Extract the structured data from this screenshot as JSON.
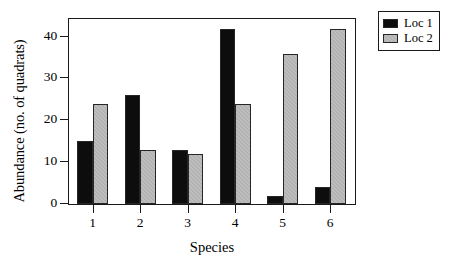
{
  "chart_data": {
    "type": "bar",
    "title": "",
    "subtitle": "",
    "xlabel": "Species",
    "ylabel": "Abundance (no. of quadrats)",
    "categories": [
      "1",
      "2",
      "3",
      "4",
      "5",
      "6"
    ],
    "series": [
      {
        "name": "Loc 1",
        "color": "#0d0d0d",
        "values": [
          15,
          26,
          13,
          42,
          2,
          4
        ]
      },
      {
        "name": "Loc 2",
        "color": "#b2b2b2",
        "values": [
          24,
          13,
          12,
          24,
          36,
          42
        ]
      }
    ],
    "ylim": [
      0,
      44
    ],
    "yticks": [
      0,
      10,
      20,
      30,
      40
    ],
    "ytick_labels": [
      "0",
      "10",
      "20",
      "30",
      "40"
    ],
    "grid": false,
    "legend_position": "outside-top-right",
    "frame": true,
    "annotations": []
  }
}
